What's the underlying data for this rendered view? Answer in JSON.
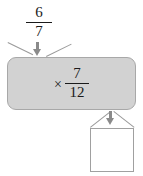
{
  "diagram": {
    "type": "function-machine",
    "title": "",
    "background_color": "#ffffff",
    "machine": {
      "fill_color": "#d2d2d2",
      "border_color": "#a8a8a8",
      "operation_symbol": "×",
      "operation_fraction": {
        "numerator": "7",
        "denominator": "12"
      }
    },
    "input": {
      "label": "",
      "fraction": {
        "numerator": "6",
        "denominator": "7"
      }
    },
    "output": {
      "label": "",
      "value": "",
      "box_border_color": "#a0a0a0",
      "box_fill_color": "#ffffff"
    },
    "connectors": {
      "arrow_color": "#8a8a8a",
      "line_color": "#9a9a9a",
      "input_arrow": "arrow-down-icon",
      "output_arrow": "arrow-down-icon"
    }
  }
}
